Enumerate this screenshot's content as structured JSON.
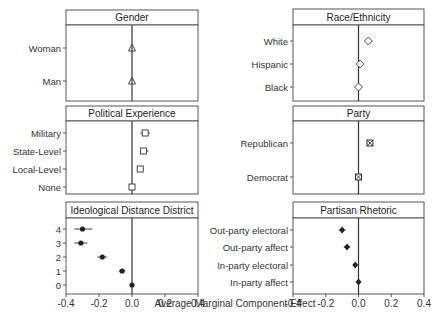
{
  "chart_data": {
    "type": "scatter",
    "subtype": "faceted dot-and-whisker (AMCE)",
    "xlabel": "Average Marginal Component Effect",
    "xlim": [
      -0.4,
      0.4
    ],
    "xticks": [
      "-0.4",
      "-0.2",
      "0.0",
      "0.2",
      "0.4"
    ],
    "reference_line": 0.0,
    "grid": false,
    "panels": [
      {
        "title": "Gender",
        "marker": "triangle",
        "levels": [
          "Woman",
          "Man"
        ],
        "estimates": [
          0.0,
          0.0
        ],
        "ci_low": [
          0.0,
          0.0
        ],
        "ci_high": [
          0.0,
          0.0
        ]
      },
      {
        "title": "Race/Ethnicity",
        "marker": "diamond",
        "levels": [
          "White",
          "Hispanic",
          "Black"
        ],
        "estimates": [
          0.06,
          0.01,
          0.0
        ],
        "ci_low": [
          0.06,
          0.01,
          0.0
        ],
        "ci_high": [
          0.06,
          0.01,
          0.0
        ]
      },
      {
        "title": "Political Experience",
        "marker": "square",
        "levels": [
          "Military",
          "State-Level",
          "Local-Level",
          "None"
        ],
        "estimates": [
          0.08,
          0.07,
          0.05,
          0.0
        ],
        "ci_low": [
          0.05,
          0.05,
          0.03,
          0.0
        ],
        "ci_high": [
          0.11,
          0.1,
          0.07,
          0.0
        ]
      },
      {
        "title": "Party",
        "marker": "square-x",
        "levels": [
          "Republican",
          "Democrat"
        ],
        "estimates": [
          0.07,
          0.0
        ],
        "ci_low": [
          0.05,
          0.0
        ],
        "ci_high": [
          0.09,
          0.0
        ]
      },
      {
        "title": "Ideological Distance District",
        "marker": "circle",
        "levels": [
          "4",
          "3",
          "2",
          "1",
          "0"
        ],
        "estimates": [
          -0.3,
          -0.31,
          -0.18,
          -0.06,
          0.0
        ],
        "ci_low": [
          -0.35,
          -0.35,
          -0.21,
          -0.08,
          0.0
        ],
        "ci_high": [
          -0.24,
          -0.27,
          -0.15,
          -0.04,
          0.0
        ]
      },
      {
        "title": "Partisan Rhetoric",
        "marker": "diamond-filled",
        "levels": [
          "Out-party electoral",
          "Out-party affect",
          "In-party electoral",
          "In-party affect"
        ],
        "estimates": [
          -0.1,
          -0.07,
          -0.02,
          0.0
        ],
        "ci_low": [
          -0.12,
          -0.09,
          -0.03,
          0.0
        ],
        "ci_high": [
          -0.08,
          -0.05,
          -0.01,
          0.0
        ]
      }
    ]
  }
}
